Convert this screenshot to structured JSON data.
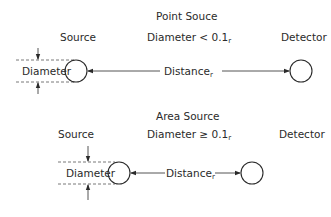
{
  "point_source": {
    "title": "Point Souce",
    "source_label": "Source",
    "detector_label": "Detector",
    "condition_prefix": "Diameter < 0.1",
    "condition_sub": "r",
    "diameter_label": "Diameter",
    "distance_label": "Distance",
    "distance_sub": "r"
  },
  "area_source": {
    "title": "Area Source",
    "source_label": "Source",
    "detector_label": "Detector",
    "condition_prefix": "Diameter ≥ 0.1",
    "condition_sub": "r",
    "diameter_label": "Diameter",
    "distance_label": "Distance",
    "distance_sub": "r"
  },
  "colors": {
    "line": "#2a2a2a",
    "dashed": "#555555",
    "background": "#ffffff"
  }
}
